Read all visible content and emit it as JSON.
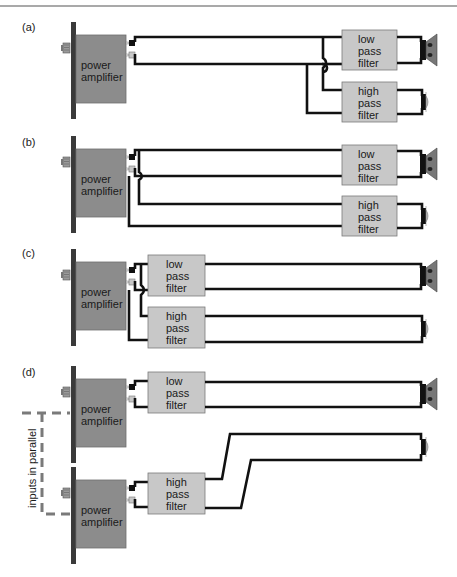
{
  "figure": {
    "panels": [
      {
        "id": "a",
        "label": "(a)",
        "amplifiers": [
          {
            "line1": "power",
            "line2": "amplifier"
          }
        ],
        "filters": [
          {
            "type": "low",
            "lines": [
              "low",
              "pass",
              "filter"
            ]
          },
          {
            "type": "high",
            "lines": [
              "high",
              "pass",
              "filter"
            ]
          }
        ],
        "speakers": [
          "woofer",
          "tweeter"
        ]
      },
      {
        "id": "b",
        "label": "(b)",
        "amplifiers": [
          {
            "line1": "power",
            "line2": "amplifier"
          }
        ],
        "filters": [
          {
            "type": "low",
            "lines": [
              "low",
              "pass",
              "filter"
            ]
          },
          {
            "type": "high",
            "lines": [
              "high",
              "pass",
              "filter"
            ]
          }
        ],
        "speakers": [
          "woofer",
          "tweeter"
        ]
      },
      {
        "id": "c",
        "label": "(c)",
        "amplifiers": [
          {
            "line1": "power",
            "line2": "amplifier"
          }
        ],
        "filters": [
          {
            "type": "low",
            "lines": [
              "low",
              "pass",
              "filter"
            ]
          },
          {
            "type": "high",
            "lines": [
              "high",
              "pass",
              "filter"
            ]
          }
        ],
        "speakers": [
          "woofer",
          "tweeter"
        ]
      },
      {
        "id": "d",
        "label": "(d)",
        "amplifiers": [
          {
            "line1": "power",
            "line2": "amplifier"
          },
          {
            "line1": "power",
            "line2": "amplifier"
          }
        ],
        "filters": [
          {
            "type": "low",
            "lines": [
              "low",
              "pass",
              "filter"
            ]
          },
          {
            "type": "high",
            "lines": [
              "high",
              "pass",
              "filter"
            ]
          }
        ],
        "speakers": [
          "woofer",
          "tweeter"
        ],
        "annotation": "inputs in parallel"
      }
    ]
  }
}
